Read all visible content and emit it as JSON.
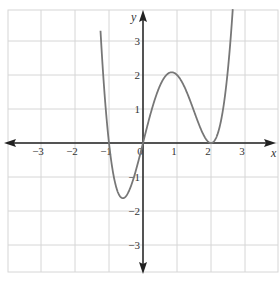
{
  "chart_data": {
    "type": "line",
    "title": "",
    "xlabel": "x",
    "ylabel": "y",
    "xlim": [
      -4.0,
      4.0
    ],
    "ylim": [
      -3.9,
      3.9
    ],
    "grid": true,
    "x_ticks": [
      -3,
      -2,
      -1,
      0,
      1,
      2,
      3
    ],
    "y_ticks": [
      -3,
      -2,
      -1,
      1,
      2,
      3
    ],
    "x_tick_labels": [
      "−3",
      "−2",
      "−1",
      "0",
      "1",
      "2",
      "3"
    ],
    "y_tick_labels": [
      "−3",
      "−2",
      "−1",
      "1",
      "2",
      "3"
    ],
    "series": [
      {
        "name": "f(x) = x(x+1)(x−2)²",
        "color": "#777777",
        "key_points": [
          {
            "x": -1,
            "y": 0,
            "note": "x-intercept"
          },
          {
            "x": -0.6,
            "y": -1.62,
            "note": "local minimum"
          },
          {
            "x": 0,
            "y": 0,
            "note": "x-intercept"
          },
          {
            "x": 0.8,
            "y": 2.07,
            "note": "local maximum"
          },
          {
            "x": 2,
            "y": 0,
            "note": "double root / local minimum"
          }
        ],
        "x": [
          -1.21,
          -1.1,
          -1.0,
          -0.9,
          -0.8,
          -0.7,
          -0.6,
          -0.5,
          -0.4,
          -0.3,
          -0.2,
          -0.1,
          0.0,
          0.2,
          0.4,
          0.6,
          0.8,
          1.0,
          1.2,
          1.4,
          1.6,
          1.8,
          2.0,
          2.2,
          2.4,
          2.55
        ],
        "y": [
          3.9,
          1.08,
          0.0,
          -0.7,
          -1.12,
          -1.32,
          -1.62,
          -1.56,
          -1.38,
          -1.1,
          -0.77,
          -0.4,
          0.0,
          0.78,
          1.43,
          1.88,
          2.07,
          2.0,
          1.69,
          1.18,
          0.61,
          0.18,
          0.0,
          0.19,
          1.09,
          2.56
        ]
      }
    ],
    "legend": null
  },
  "axes": {
    "x_label": "x",
    "y_label": "y",
    "origin_label": "0"
  },
  "colors": {
    "grid": "#d6d6d6",
    "axis": "#222222",
    "curve": "#777777",
    "border": "#d6d6d6"
  }
}
